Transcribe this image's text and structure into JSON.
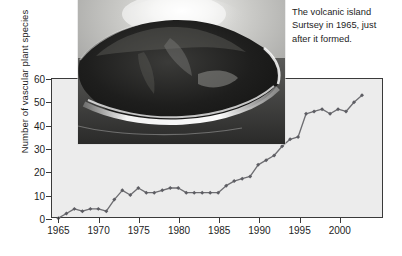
{
  "figure": {
    "caption": "The volcanic island Surtsey in 1965, just after it formed.",
    "photo_alt": "volcanic-island-surtsey-photo"
  },
  "chart_data": {
    "type": "line",
    "title": "",
    "xlabel": "",
    "ylabel": "Number of vascular plant species",
    "xlim": [
      1964.2,
      2005.5
    ],
    "ylim": [
      0,
      60
    ],
    "grid": false,
    "legend": null,
    "xticks": [
      1965,
      1970,
      1975,
      1980,
      1985,
      1990,
      1995,
      2000
    ],
    "xtick_labels": [
      "1965",
      "1970",
      "1975",
      "1980",
      "1985",
      "1990",
      "1995",
      "2000"
    ],
    "yticks": [
      0,
      10,
      20,
      30,
      40,
      50,
      60
    ],
    "ytick_labels": [
      "0",
      "10",
      "20",
      "30",
      "40",
      "50",
      "60"
    ],
    "series": [
      {
        "name": "Vascular plant species on Surtsey",
        "color": "#6e6e72",
        "x": [
          1965,
          1966,
          1967,
          1968,
          1969,
          1970,
          1971,
          1972,
          1973,
          1974,
          1975,
          1976,
          1977,
          1978,
          1979,
          1980,
          1981,
          1982,
          1983,
          1984,
          1985,
          1986,
          1987,
          1988,
          1989,
          1990,
          1991,
          1992,
          1993,
          1994,
          1995,
          1996,
          1997,
          1998,
          1999,
          2000,
          2001,
          2002,
          2003
        ],
        "values": [
          0,
          2,
          4,
          3,
          4,
          4,
          3,
          8,
          12,
          10,
          13,
          11,
          11,
          12,
          13,
          13,
          11,
          11,
          11,
          11,
          11,
          14,
          16,
          17,
          18,
          23,
          25,
          27,
          31,
          34,
          35,
          45,
          46,
          47,
          45,
          47,
          46,
          50,
          53
        ]
      }
    ]
  }
}
